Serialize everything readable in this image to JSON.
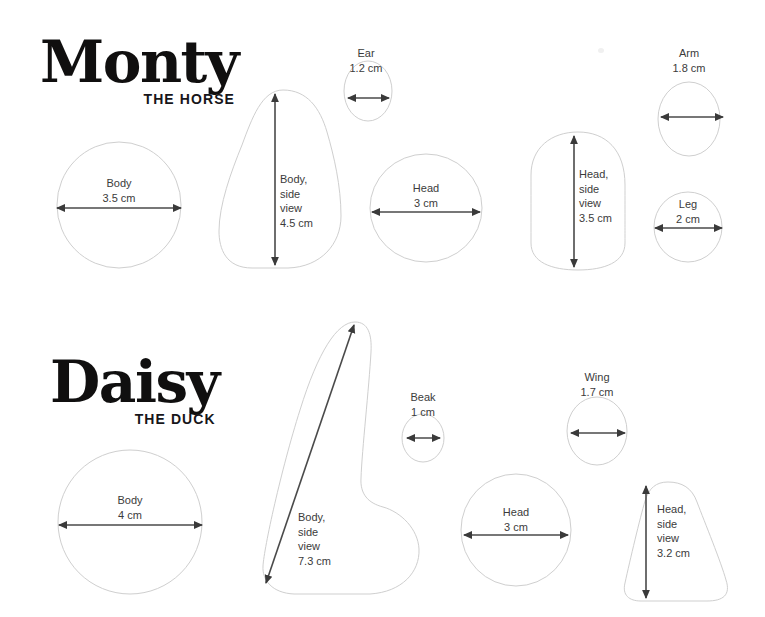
{
  "page": {
    "background_color": "#ffffff",
    "outline_color": "#cfcfcf",
    "dimension_color": "#4a4a4a",
    "text_color": "#3b3b3b"
  },
  "sections": [
    {
      "id": "monty",
      "title": "Monty",
      "subtitle": "THE HORSE",
      "pieces": [
        {
          "id": "monty-body",
          "name": "Body",
          "measure": "3.5 cm",
          "label": "Body\n3.5 cm",
          "shape": "circle",
          "orientation": "horizontal"
        },
        {
          "id": "monty-body-side",
          "name": "Body, side view",
          "measure": "4.5 cm",
          "label": "Body,\nside\nview\n4.5 cm",
          "shape": "pear",
          "orientation": "vertical"
        },
        {
          "id": "monty-ear",
          "name": "Ear",
          "measure": "1.2 cm",
          "label": "Ear\n1.2 cm",
          "shape": "circle",
          "orientation": "horizontal"
        },
        {
          "id": "monty-head",
          "name": "Head",
          "measure": "3 cm",
          "label": "Head\n3 cm",
          "shape": "circle",
          "orientation": "horizontal"
        },
        {
          "id": "monty-head-side",
          "name": "Head, side view",
          "measure": "3.5 cm",
          "label": "Head,\nside\nview\n3.5 cm",
          "shape": "rounded-egg",
          "orientation": "vertical"
        },
        {
          "id": "monty-arm",
          "name": "Arm",
          "measure": "1.8 cm",
          "label": "Arm\n1.8 cm",
          "shape": "circle",
          "orientation": "horizontal"
        },
        {
          "id": "monty-leg",
          "name": "Leg",
          "measure": "2 cm",
          "label": "Leg\n2 cm",
          "shape": "circle",
          "orientation": "horizontal"
        }
      ]
    },
    {
      "id": "daisy",
      "title": "Daisy",
      "subtitle": "THE DUCK",
      "pieces": [
        {
          "id": "daisy-body",
          "name": "Body",
          "measure": "4 cm",
          "label": "Body\n4 cm",
          "shape": "circle",
          "orientation": "horizontal"
        },
        {
          "id": "daisy-body-side",
          "name": "Body, side view",
          "measure": "7.3 cm",
          "label": "Body,\nside\nview\n7.3 cm",
          "shape": "duck-body",
          "orientation": "diagonal"
        },
        {
          "id": "daisy-beak",
          "name": "Beak",
          "measure": "1 cm",
          "label": "Beak\n1 cm",
          "shape": "circle",
          "orientation": "horizontal"
        },
        {
          "id": "daisy-head",
          "name": "Head",
          "measure": "3 cm",
          "label": "Head\n3 cm",
          "shape": "circle",
          "orientation": "horizontal"
        },
        {
          "id": "daisy-wing",
          "name": "Wing",
          "measure": "1.7 cm",
          "label": "Wing\n1.7 cm",
          "shape": "circle",
          "orientation": "horizontal"
        },
        {
          "id": "daisy-head-side",
          "name": "Head, side view",
          "measure": "3.2 cm",
          "label": "Head,\nside\nview\n3.2 cm",
          "shape": "bell",
          "orientation": "vertical"
        }
      ]
    }
  ],
  "labels": {
    "monty_body": "Body\n3.5 cm",
    "monty_body_side": "Body,\nside\nview\n4.5 cm",
    "monty_ear": "Ear\n1.2 cm",
    "monty_head": "Head\n3 cm",
    "monty_head_side": "Head,\nside\nview\n3.5 cm",
    "monty_arm": "Arm\n1.8 cm",
    "monty_leg": "Leg\n2 cm",
    "daisy_body": "Body\n4 cm",
    "daisy_body_side": "Body,\nside\nview\n7.3 cm",
    "daisy_beak": "Beak\n1 cm",
    "daisy_head": "Head\n3 cm",
    "daisy_wing": "Wing\n1.7 cm",
    "daisy_head_side": "Head,\nside\nview\n3.2 cm"
  },
  "titles": {
    "monty_name": "Monty",
    "monty_sub": "THE HORSE",
    "daisy_name": "Daisy",
    "daisy_sub": "THE DUCK"
  }
}
